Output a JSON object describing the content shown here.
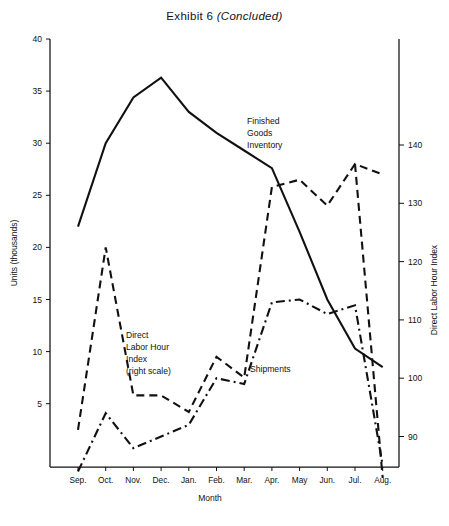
{
  "title": {
    "main": "Exhibit 6",
    "suffix": "(Concluded)"
  },
  "axes": {
    "left_title": "Units (thousands)",
    "right_title": "Direct Labor Hour Index",
    "x_title": "Month",
    "left_ticks": [
      "5",
      "10",
      "15",
      "20",
      "25",
      "30",
      "35",
      "40"
    ],
    "right_ticks": [
      "90",
      "100",
      "110",
      "120",
      "130",
      "140"
    ]
  },
  "annotations": {
    "finished_goods": [
      "Finished",
      "Goods",
      "Inventory"
    ],
    "direct_labor": [
      "Direct",
      "Labor Hour",
      "Index",
      "(right scale)"
    ],
    "shipments": "Shipments"
  },
  "chart_data": {
    "type": "line",
    "title": "Exhibit 6 (Concluded)",
    "xlabel": "Month",
    "ylabel": "Units (thousands)",
    "y2label": "Direct Labor Hour Index",
    "categories": [
      "Sep.",
      "Oct.",
      "Nov.",
      "Dec.",
      "Jan.",
      "Feb.",
      "Mar.",
      "Apr.",
      "May",
      "Jun.",
      "Jul.",
      "Aug."
    ],
    "ylim": [
      0,
      40
    ],
    "y2lim": [
      82.5,
      147.5
    ],
    "grid": false,
    "legend": "inline-annotations",
    "series": [
      {
        "name": "Finished Goods Inventory",
        "style": "solid",
        "axis": "left",
        "values": [
          22.0,
          30.0,
          34.4,
          36.3,
          33.0,
          31.0,
          29.3,
          27.6,
          21.5,
          15.0,
          10.3,
          8.5
        ]
      },
      {
        "name": "Shipments",
        "style": "dashed",
        "axis": "left",
        "values": [
          2.5,
          20.0,
          5.8,
          5.8,
          4.2,
          9.5,
          7.5,
          25.8,
          26.5,
          24.0,
          28.0,
          27.0
        ]
      },
      {
        "name": "Direct Labor Hour Index",
        "style": "dash-dot",
        "axis": "right",
        "values": [
          84.0,
          94.0,
          88.0,
          90.0,
          92.0,
          100.0,
          99.0,
          113.0,
          113.5,
          111.0,
          112.5,
          85.0
        ]
      }
    ]
  }
}
